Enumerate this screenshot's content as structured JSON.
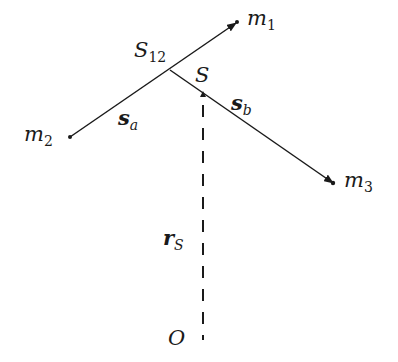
{
  "diagram": {
    "colors": {
      "ink": "#1a1a1a",
      "background": "#ffffff"
    },
    "nodes": [
      {
        "id": "m1",
        "label": "m",
        "sub": "1"
      },
      {
        "id": "m2",
        "label": "m",
        "sub": "2"
      },
      {
        "id": "m3",
        "label": "m",
        "sub": "3"
      },
      {
        "id": "S12",
        "label": "S",
        "sub": "12"
      },
      {
        "id": "S",
        "label": "S"
      },
      {
        "id": "O",
        "label": "O"
      }
    ],
    "edges": [
      {
        "id": "s_a",
        "from": "m2",
        "to": "m1",
        "label": "s",
        "sub": "a",
        "style": "solid-arrow"
      },
      {
        "id": "s_b",
        "from": "S12",
        "to": "m3",
        "label": "s",
        "sub": "b",
        "style": "solid-arrow"
      },
      {
        "id": "r_S",
        "from": "O",
        "to": "S",
        "label": "r",
        "sub": "S",
        "style": "dashed"
      }
    ]
  }
}
